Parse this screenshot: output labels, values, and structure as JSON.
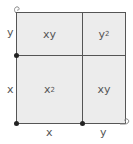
{
  "diagram": {
    "regions": {
      "top_left": {
        "base": "xy",
        "sup": ""
      },
      "top_right": {
        "base": "y",
        "sup": "2"
      },
      "bottom_left": {
        "base": "x",
        "sup": "2"
      },
      "bottom_right": {
        "base": "xy",
        "sup": ""
      }
    },
    "side_labels": {
      "left_top": "y",
      "left_bottom": "x",
      "bottom_left": "x",
      "bottom_right": "y"
    },
    "colors": {
      "fill": "#ececec",
      "line": "#555555",
      "dot": "#222222"
    }
  }
}
